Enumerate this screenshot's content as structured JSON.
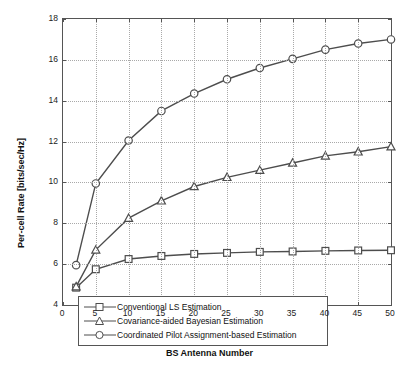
{
  "chart_data": {
    "type": "line",
    "title": "",
    "xlabel": "BS Antenna Number",
    "ylabel": "Per-cell Rate [bits/sec/Hz]",
    "xlim": [
      0,
      50
    ],
    "ylim": [
      4,
      18
    ],
    "xticks": [
      0,
      5,
      10,
      15,
      20,
      25,
      30,
      35,
      40,
      45,
      50
    ],
    "yticks": [
      4,
      6,
      8,
      10,
      12,
      14,
      16,
      18
    ],
    "grid": true,
    "legend_position": "bottom-left-inside",
    "x": [
      2,
      5,
      10,
      15,
      20,
      25,
      30,
      35,
      40,
      45,
      50
    ],
    "series": [
      {
        "name": "Conventional LS Estimation",
        "marker": "square",
        "color": "#4d4d4d",
        "values": [
          4.85,
          5.75,
          6.25,
          6.4,
          6.5,
          6.55,
          6.6,
          6.62,
          6.65,
          6.67,
          6.68
        ]
      },
      {
        "name": "Covariance-aided Bayesian Estimation",
        "marker": "triangle",
        "color": "#4d4d4d",
        "values": [
          4.9,
          6.7,
          8.25,
          9.1,
          9.8,
          10.25,
          10.6,
          10.95,
          11.3,
          11.5,
          11.75
        ]
      },
      {
        "name": "Coordinated Pilot Assignment-based Estimation",
        "marker": "circle",
        "color": "#4d4d4d",
        "values": [
          5.95,
          9.95,
          12.05,
          13.5,
          14.35,
          15.05,
          15.6,
          16.05,
          16.5,
          16.8,
          17.0
        ]
      }
    ]
  },
  "legend": {
    "items": [
      {
        "label": "Conventional LS Estimation"
      },
      {
        "label": "Covariance-aided Bayesian Estimation"
      },
      {
        "label": "Coordinated Pilot Assignment-based Estimation"
      }
    ]
  }
}
